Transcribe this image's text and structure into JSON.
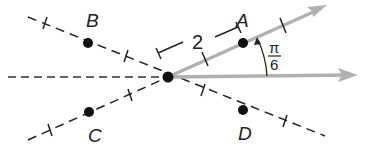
{
  "diagram": {
    "pole": {
      "x": 168,
      "y": 77
    },
    "points": [
      {
        "name": "A",
        "label": "A",
        "x": 243,
        "y": 43,
        "lx": 241,
        "ly": 26
      },
      {
        "name": "B",
        "label": "B",
        "x": 88,
        "y": 43,
        "lx": 86,
        "ly": 26
      },
      {
        "name": "C",
        "label": "C",
        "x": 89,
        "y": 112,
        "lx": 88,
        "ly": 142
      },
      {
        "name": "D",
        "label": "D",
        "x": 243,
        "y": 110,
        "lx": 238,
        "ly": 140
      }
    ],
    "length_label": "2",
    "angle_label": {
      "numerator": "π",
      "denominator": "6"
    },
    "colors": {
      "ray": "#b0b0b0",
      "dashed": "#222222",
      "point": "#111111"
    }
  }
}
